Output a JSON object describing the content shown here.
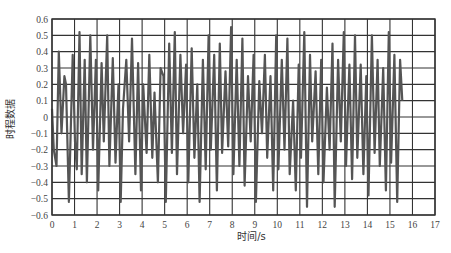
{
  "chart_data": {
    "type": "line",
    "title": "",
    "xlabel": "时间/s",
    "ylabel": "时程数据",
    "xlim": [
      0,
      17
    ],
    "ylim": [
      -0.6,
      0.6
    ],
    "x_ticks": [
      0,
      1,
      2,
      3,
      4,
      5,
      6,
      7,
      8,
      9,
      10,
      11,
      12,
      13,
      14,
      15,
      16,
      17
    ],
    "x_tick_labels": [
      "0",
      "1",
      "2",
      "3",
      "4",
      "5",
      "6",
      "7",
      "8",
      "9",
      "10",
      "11",
      "12",
      "13",
      "14",
      "15",
      "16",
      "17"
    ],
    "y_ticks": [
      -0.6,
      -0.5,
      -0.4,
      -0.3,
      -0.2,
      -0.1,
      0,
      0.1,
      0.2,
      0.3,
      0.4,
      0.5,
      0.6
    ],
    "y_tick_labels": [
      "−0.6",
      "−0.5",
      "−0.4",
      "−0.3",
      "−0.2",
      "−0.1",
      "0",
      "0.1",
      "0.2",
      "0.3",
      "0.4",
      "0.5",
      "0.6"
    ],
    "grid": true,
    "line_color": "#555555",
    "series": [
      {
        "name": "时程数据",
        "x": [
          0.0,
          0.08,
          0.2,
          0.3,
          0.42,
          0.55,
          0.62,
          0.75,
          0.92,
          1.02,
          1.1,
          1.22,
          1.32,
          1.45,
          1.55,
          1.7,
          1.82,
          1.95,
          2.05,
          2.2,
          2.3,
          2.45,
          2.55,
          2.7,
          2.82,
          2.95,
          3.05,
          3.15,
          3.3,
          3.42,
          3.55,
          3.7,
          3.82,
          3.95,
          4.05,
          4.2,
          4.32,
          4.45,
          4.55,
          4.7,
          4.82,
          4.95,
          5.05,
          5.2,
          5.32,
          5.45,
          5.55,
          5.7,
          5.82,
          5.95,
          6.05,
          6.2,
          6.32,
          6.45,
          6.55,
          6.7,
          6.82,
          6.95,
          7.05,
          7.2,
          7.32,
          7.45,
          7.55,
          7.7,
          7.82,
          7.95,
          8.05,
          8.2,
          8.32,
          8.45,
          8.55,
          8.7,
          8.82,
          8.95,
          9.05,
          9.2,
          9.32,
          9.45,
          9.55,
          9.7,
          9.82,
          9.95,
          10.05,
          10.2,
          10.32,
          10.45,
          10.55,
          10.7,
          10.82,
          10.95,
          11.05,
          11.2,
          11.32,
          11.45,
          11.55,
          11.7,
          11.82,
          11.95,
          12.05,
          12.2,
          12.32,
          12.45,
          12.55,
          12.7,
          12.82,
          12.95,
          13.05,
          13.2,
          13.32,
          13.45,
          13.55,
          13.7,
          13.82,
          13.95,
          14.05,
          14.2,
          14.32,
          14.45,
          14.55,
          14.7,
          14.82,
          14.95,
          15.05,
          15.2,
          15.32,
          15.45,
          15.55
        ],
        "y": [
          0.05,
          -0.2,
          -0.3,
          0.4,
          -0.1,
          0.25,
          0.2,
          -0.52,
          0.38,
          -0.15,
          -0.32,
          0.52,
          -0.35,
          0.35,
          -0.4,
          0.5,
          -0.2,
          0.35,
          -0.45,
          0.33,
          -0.15,
          0.5,
          -0.3,
          0.36,
          -0.28,
          0.2,
          -0.52,
          0.05,
          0.35,
          -0.15,
          0.48,
          -0.35,
          0.33,
          -0.45,
          0.2,
          -0.22,
          0.38,
          -0.25,
          0.15,
          -0.4,
          0.3,
          0.25,
          -0.52,
          0.45,
          -0.22,
          0.52,
          -0.35,
          0.38,
          -0.1,
          0.32,
          -0.4,
          0.42,
          -0.25,
          0.2,
          -0.52,
          0.35,
          -0.32,
          0.5,
          -0.2,
          0.38,
          -0.45,
          0.45,
          -0.22,
          0.28,
          -0.18,
          0.55,
          -0.35,
          0.35,
          -0.3,
          0.48,
          -0.42,
          0.25,
          -0.15,
          0.38,
          -0.52,
          0.22,
          -0.1,
          0.38,
          -0.25,
          0.25,
          -0.45,
          0.5,
          -0.32,
          0.35,
          -0.2,
          0.48,
          -0.35,
          0.1,
          -0.45,
          0.32,
          -0.25,
          0.52,
          -0.55,
          0.38,
          -0.15,
          0.28,
          -0.35,
          0.35,
          -0.4,
          0.18,
          -0.2,
          0.45,
          -0.55,
          0.35,
          -0.15,
          0.52,
          -0.3,
          0.32,
          -0.38,
          0.5,
          -0.25,
          0.32,
          -0.35,
          0.25,
          -0.48,
          0.5,
          -0.22,
          0.35,
          -0.3,
          0.3,
          -0.45,
          0.52,
          -0.28,
          0.38,
          -0.52,
          0.35,
          0.1
        ]
      }
    ]
  }
}
